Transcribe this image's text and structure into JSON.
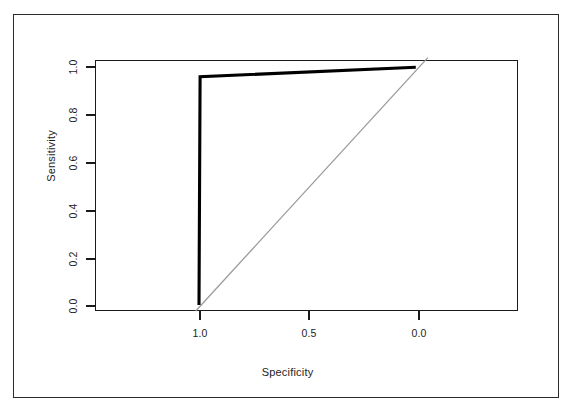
{
  "chart_data": {
    "type": "line",
    "title": "",
    "xlabel": "Specificity",
    "ylabel": "Sensitivity",
    "xlim": [
      1.0,
      0.0
    ],
    "xlim_note": "x-axis reversed (specificity decreasing left to right)",
    "ylim": [
      0.0,
      1.0
    ],
    "grid": false,
    "legend": null,
    "xticks": [
      "1.0",
      "0.5",
      "0.0"
    ],
    "xtick_values": [
      1.0,
      0.5,
      0.0
    ],
    "yticks": [
      "0.0",
      "0.2",
      "0.4",
      "0.6",
      "0.8",
      "1.0"
    ],
    "ytick_values": [
      0.0,
      0.2,
      0.4,
      0.6,
      0.8,
      1.0
    ],
    "series": [
      {
        "name": "ROC curve",
        "style": "solid-thick-black",
        "color": "#000000",
        "x": [
          1.0,
          0.995,
          0.01
        ],
        "y": [
          0.0,
          0.955,
          0.995
        ]
      },
      {
        "name": "chance diagonal",
        "style": "solid-thin-gray",
        "color": "#9a9a9a",
        "x": [
          1.015,
          -0.045
        ],
        "y": [
          -0.025,
          1.035
        ]
      }
    ]
  },
  "axes": {
    "x_title": "Specificity",
    "y_title": "Sensitivity",
    "x_tick_labels": [
      "1.0",
      "0.5",
      "0.0"
    ],
    "y_tick_labels": [
      "1.0",
      "0.8",
      "0.6",
      "0.4",
      "0.2",
      "0.0"
    ]
  },
  "colors": {
    "curve": "#000000",
    "reference_line": "#9a9a9a",
    "axis": "#1a1a1a",
    "frame": "#2b2b2b",
    "background": "#ffffff"
  }
}
